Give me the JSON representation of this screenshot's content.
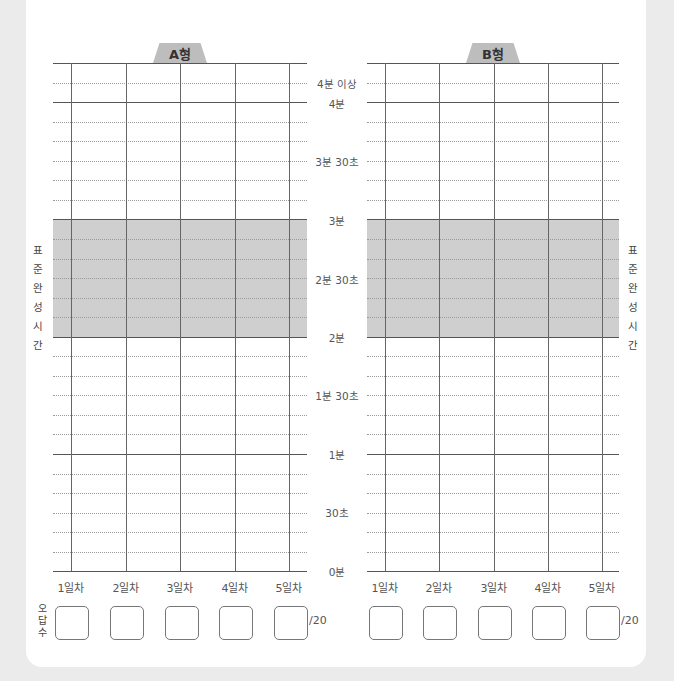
{
  "charts": [
    {
      "label": "A형",
      "id": "a"
    },
    {
      "label": "B형",
      "id": "b"
    }
  ],
  "y_axis_labels": {
    "over4": "4분 이상",
    "m4": "4분",
    "m3s30": "3분 30초",
    "m3": "3분",
    "m2s30": "2분 30초",
    "m2": "2분",
    "m1s30": "1분 30초",
    "m1": "1분",
    "s30": "30초",
    "m0": "0분"
  },
  "x_axis_labels": [
    "1일차",
    "2일차",
    "3일차",
    "4일차",
    "5일차"
  ],
  "standard_time_label": "표준완성시간",
  "wrong_answers_label": "오답수",
  "answer_total": "/20",
  "colors": {
    "standard_band": "#cfcfcf",
    "tab": "#bdbdbd",
    "background": "#ebebeb"
  },
  "chart_data": [
    {
      "type": "line",
      "title": "A형",
      "xlabel": "",
      "ylabel": "표준완성시간",
      "categories": [
        "1일차",
        "2일차",
        "3일차",
        "4일차",
        "5일차"
      ],
      "y_ticks": [
        "0분",
        "30초",
        "1분",
        "1분 30초",
        "2분",
        "2분 30초",
        "3분",
        "3분 30초",
        "4분",
        "4분 이상"
      ],
      "ylim": [
        0,
        4.5
      ],
      "y_unit": "minutes",
      "grid": true,
      "shaded_band": {
        "from": 2,
        "to": 3,
        "label": "표준완성시간"
      },
      "series": [],
      "wrong_answers_out_of": 20
    },
    {
      "type": "line",
      "title": "B형",
      "xlabel": "",
      "ylabel": "표준완성시간",
      "categories": [
        "1일차",
        "2일차",
        "3일차",
        "4일차",
        "5일차"
      ],
      "y_ticks": [
        "0분",
        "30초",
        "1분",
        "1분 30초",
        "2분",
        "2분 30초",
        "3분",
        "3분 30초",
        "4분",
        "4분 이상"
      ],
      "ylim": [
        0,
        4.5
      ],
      "y_unit": "minutes",
      "grid": true,
      "shaded_band": {
        "from": 2,
        "to": 3,
        "label": "표준완성시간"
      },
      "series": [],
      "wrong_answers_out_of": 20
    }
  ]
}
